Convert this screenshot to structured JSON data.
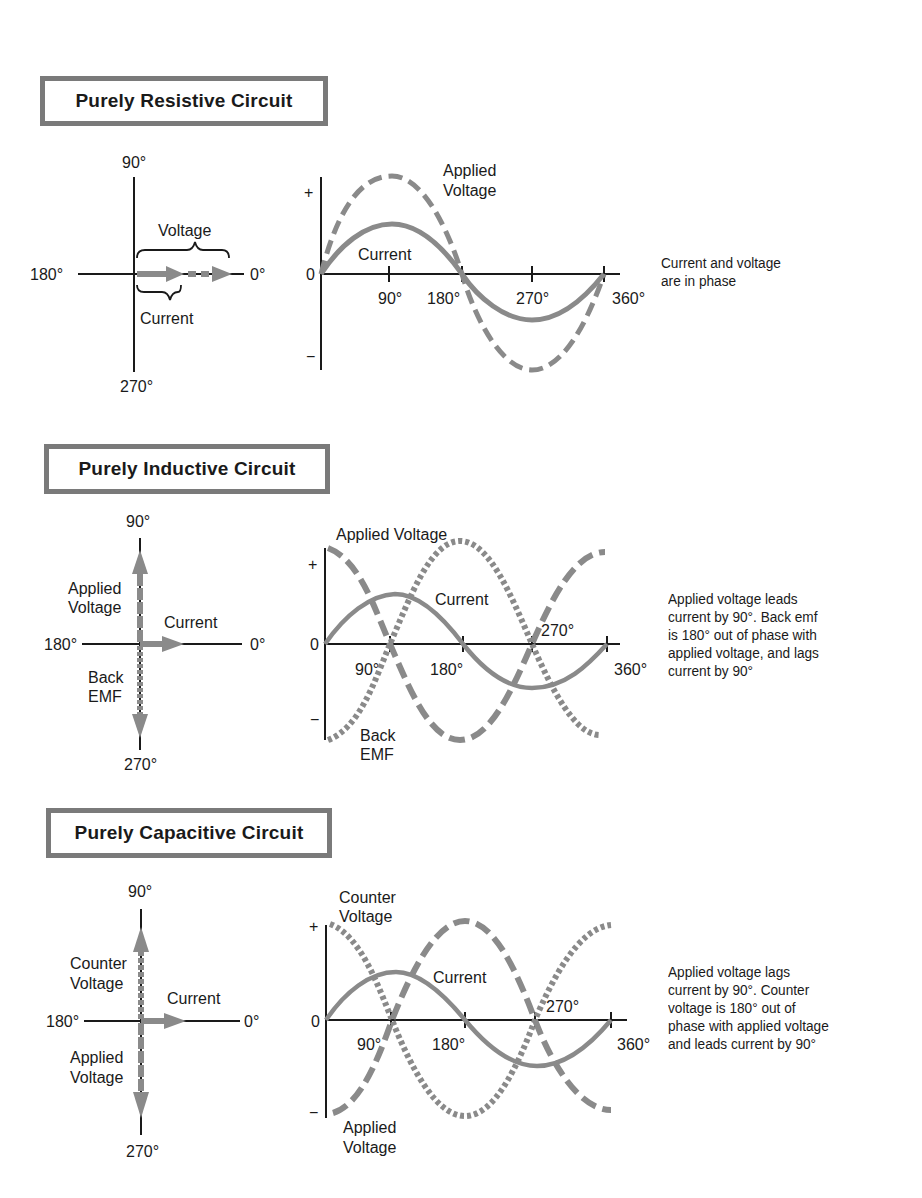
{
  "sections": [
    {
      "title": "Purely Resistive Circuit",
      "phasor": {
        "axis_labels": {
          "top": "90°",
          "left": "180°",
          "right": "0°",
          "bottom": "270°"
        },
        "vectors": [
          {
            "name": "Voltage",
            "angle": 0,
            "style": "dashed"
          },
          {
            "name": "Current",
            "angle": 0,
            "style": "solid"
          }
        ]
      },
      "waveform": {
        "y_labels": {
          "plus": "+",
          "zero": "0",
          "minus": "−"
        },
        "x_ticks": [
          "90°",
          "180°",
          "270°",
          "360°"
        ],
        "curve_labels": [
          "Applied Voltage",
          "Current"
        ]
      },
      "note": "Current and voltage\nare in phase"
    },
    {
      "title": "Purely Inductive Circuit",
      "phasor": {
        "axis_labels": {
          "top": "90°",
          "left": "180°",
          "right": "0°",
          "bottom": "270°"
        },
        "vectors": [
          {
            "name": "Applied Voltage",
            "angle": 90,
            "style": "dashed"
          },
          {
            "name": "Current",
            "angle": 0,
            "style": "solid"
          },
          {
            "name": "Back EMF",
            "angle": 270,
            "style": "dotted"
          }
        ]
      },
      "waveform": {
        "y_labels": {
          "plus": "+",
          "zero": "0",
          "minus": "−"
        },
        "x_ticks": [
          "90°",
          "180°",
          "270°",
          "360°"
        ],
        "curve_labels": [
          "Applied Voltage",
          "Current",
          "Back EMF"
        ]
      },
      "note": "Applied voltage leads\ncurrent by 90°.  Back emf\nis 180° out of phase with\napplied voltage, and lags\ncurrent by 90°"
    },
    {
      "title": "Purely Capacitive Circuit",
      "phasor": {
        "axis_labels": {
          "top": "90°",
          "left": "180°",
          "right": "0°",
          "bottom": "270°"
        },
        "vectors": [
          {
            "name": "Counter Voltage",
            "angle": 90,
            "style": "dotted"
          },
          {
            "name": "Current",
            "angle": 0,
            "style": "solid"
          },
          {
            "name": "Applied Voltage",
            "angle": 270,
            "style": "dashed"
          }
        ]
      },
      "waveform": {
        "y_labels": {
          "plus": "+",
          "zero": "0",
          "minus": "−"
        },
        "x_ticks": [
          "90°",
          "180°",
          "270°",
          "360°"
        ],
        "curve_labels": [
          "Counter Voltage",
          "Current",
          "Applied Voltage"
        ]
      },
      "note": "Applied voltage lags\ncurrent by 90°.  Counter\nvoltage is 180° out of\nphase with applied voltage\nand leads current by 90°"
    }
  ],
  "colors": {
    "curve": "#8a8a8a",
    "axis": "#1a1a1a",
    "border": "#7a7a7a"
  }
}
